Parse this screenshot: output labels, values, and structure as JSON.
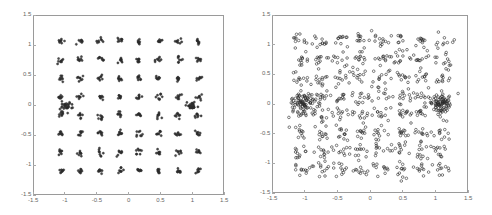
{
  "chart_data": [
    {
      "type": "scatter",
      "title": "",
      "xlabel": "",
      "ylabel": "",
      "xlim": [
        -1.5,
        1.5
      ],
      "ylim": [
        -1.5,
        1.5
      ],
      "xticks": [
        "-1.5",
        "-1",
        "-0.5",
        "0",
        "0.5",
        "1",
        "1.5"
      ],
      "yticks": [
        "1.5",
        "1",
        "0.5",
        "0",
        "-0.5",
        "-1",
        "-1.5"
      ],
      "grid": false,
      "description": "64-point constellation, tight clusters (low noise) with dense clusters near (-1,0) and (1,0)",
      "constellation_levels": [
        -1.08,
        -0.77,
        -0.46,
        -0.15,
        0.15,
        0.46,
        0.77,
        1.08
      ],
      "noise_std": 0.025,
      "points_per_symbol": 8,
      "dense_clusters": [
        {
          "x": -1.0,
          "y": 0.0,
          "count": 30,
          "std": 0.04
        },
        {
          "x": 0.97,
          "y": 0.0,
          "count": 25,
          "std": 0.035
        }
      ]
    },
    {
      "type": "scatter",
      "title": "",
      "xlabel": "",
      "ylabel": "",
      "xlim": [
        -1.5,
        1.5
      ],
      "ylim": [
        -1.5,
        1.5
      ],
      "xticks": [
        "-1.5",
        "-1",
        "-0.5",
        "0",
        "0.5",
        "1",
        "1.5"
      ],
      "yticks": [
        "1.5",
        "1",
        "0.5",
        "0",
        "-0.5",
        "-1",
        "-1.5"
      ],
      "grid": false,
      "description": "Same 64-point constellation with heavy noise, dense clusters near (-1,0) and (1,0)",
      "constellation_levels": [
        -1.08,
        -0.77,
        -0.46,
        -0.15,
        0.15,
        0.46,
        0.77,
        1.08
      ],
      "noise_std": 0.07,
      "points_per_symbol": 11,
      "dense_clusters": [
        {
          "x": -1.02,
          "y": 0.02,
          "count": 70,
          "std": 0.08
        },
        {
          "x": 1.02,
          "y": 0.02,
          "count": 70,
          "std": 0.08
        }
      ]
    }
  ],
  "panels": [
    {
      "left": 33,
      "top": 15,
      "width": 191,
      "height": 180
    },
    {
      "left": 272,
      "top": 15,
      "width": 196,
      "height": 178
    }
  ],
  "colors": {
    "marker": "#2a2a2a",
    "axis": "#9a9a9a",
    "tick_text": "#666666"
  }
}
